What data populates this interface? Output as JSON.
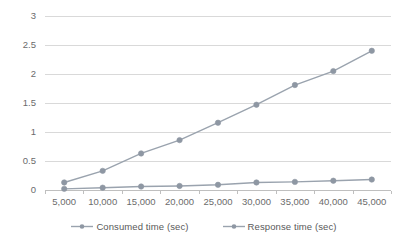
{
  "chart_data": {
    "type": "line",
    "title": "",
    "xlabel": "",
    "ylabel": "",
    "categories": [
      "5,000",
      "10,000",
      "15,000",
      "20,000",
      "25,000",
      "30,000",
      "35,000",
      "40,000",
      "45,000"
    ],
    "x_values": [
      5000,
      10000,
      15000,
      20000,
      25000,
      30000,
      35000,
      40000,
      45000
    ],
    "series": [
      {
        "name": "Consumed time (sec)",
        "color": "#8e97a3",
        "marker": "circle",
        "values": [
          0.13,
          0.33,
          0.63,
          0.86,
          1.16,
          1.47,
          1.81,
          2.05,
          2.4
        ]
      },
      {
        "name": "Response time (sec)",
        "color": "#9aa3ae",
        "marker": "circle",
        "values": [
          0.02,
          0.04,
          0.06,
          0.07,
          0.09,
          0.13,
          0.14,
          0.16,
          0.18
        ]
      }
    ],
    "y_ticks": [
      "0",
      "0.5",
      "1",
      "1.5",
      "2",
      "2.5",
      "3"
    ],
    "y_tick_values": [
      0,
      0.5,
      1,
      1.5,
      2,
      2.5,
      3
    ],
    "ylim": [
      0,
      3
    ],
    "grid": "horizontal",
    "legend_position": "bottom",
    "gridline_color": "#d9d9d9",
    "axis_color": "#bfbfbf",
    "tick_label_color": "#6b6b6b",
    "background": "#ffffff"
  },
  "legend": {
    "items": [
      {
        "label": "Consumed time (sec)"
      },
      {
        "label": "Response time (sec)"
      }
    ]
  }
}
